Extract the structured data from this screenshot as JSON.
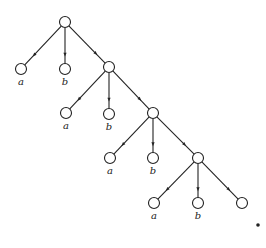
{
  "diagram": {
    "type": "infinite-branching-tree",
    "node_radius": 5.5,
    "nodes": [
      {
        "id": "r0",
        "x": 65,
        "y": 22,
        "label": ""
      },
      {
        "id": "a1",
        "x": 21,
        "y": 69,
        "label": "a"
      },
      {
        "id": "b1",
        "x": 65,
        "y": 69,
        "label": "b"
      },
      {
        "id": "r1",
        "x": 109,
        "y": 67,
        "label": ""
      },
      {
        "id": "a2",
        "x": 66,
        "y": 113,
        "label": "a"
      },
      {
        "id": "b2",
        "x": 109,
        "y": 114,
        "label": "b"
      },
      {
        "id": "r2",
        "x": 153,
        "y": 113,
        "label": ""
      },
      {
        "id": "a3",
        "x": 110,
        "y": 158,
        "label": "a"
      },
      {
        "id": "b3",
        "x": 153,
        "y": 158,
        "label": "b"
      },
      {
        "id": "r3",
        "x": 198,
        "y": 158,
        "label": ""
      },
      {
        "id": "a4",
        "x": 154,
        "y": 203,
        "label": "a"
      },
      {
        "id": "b4",
        "x": 198,
        "y": 203,
        "label": "b"
      },
      {
        "id": "r4",
        "x": 242,
        "y": 203,
        "label": ""
      }
    ],
    "edges": [
      [
        "r0",
        "a1"
      ],
      [
        "r0",
        "b1"
      ],
      [
        "r0",
        "r1"
      ],
      [
        "r1",
        "a2"
      ],
      [
        "r1",
        "b2"
      ],
      [
        "r1",
        "r2"
      ],
      [
        "r2",
        "a3"
      ],
      [
        "r2",
        "b3"
      ],
      [
        "r2",
        "r3"
      ],
      [
        "r3",
        "a4"
      ],
      [
        "r3",
        "b4"
      ],
      [
        "r3",
        "r4"
      ]
    ],
    "continuation_dot": {
      "x": 258,
      "y": 225
    },
    "colors": {
      "stroke": "#222222",
      "background": "#ffffff"
    }
  }
}
